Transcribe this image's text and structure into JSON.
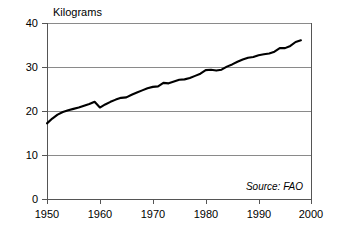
{
  "chart_data": {
    "type": "line",
    "title": "Kilograms",
    "xlabel": "",
    "ylabel": "Kilograms",
    "xlim": [
      1950,
      2000
    ],
    "ylim": [
      0,
      40
    ],
    "grid": true,
    "legend": false,
    "legend_position": "none",
    "annotations": [
      {
        "text": "Source: FAO",
        "position": "bottom-right",
        "style": "italic"
      }
    ],
    "y_ticks": [
      0,
      10,
      20,
      30,
      40
    ],
    "y_tick_labels": [
      "0",
      "10",
      "20",
      "30",
      "40"
    ],
    "x_ticks": [
      1950,
      1960,
      1970,
      1980,
      1990,
      2000
    ],
    "x_tick_labels": [
      "1950",
      "1960",
      "1970",
      "1980",
      "1990",
      "2000"
    ],
    "series": [
      {
        "name": "World per capita consumption",
        "color": "#000000",
        "x": [
          1950,
          1951,
          1952,
          1953,
          1954,
          1955,
          1956,
          1957,
          1958,
          1959,
          1960,
          1961,
          1962,
          1963,
          1964,
          1965,
          1966,
          1967,
          1968,
          1969,
          1970,
          1971,
          1972,
          1973,
          1974,
          1975,
          1976,
          1977,
          1978,
          1979,
          1980,
          1981,
          1982,
          1983,
          1984,
          1985,
          1986,
          1987,
          1988,
          1989,
          1990,
          1991,
          1992,
          1993,
          1994,
          1995,
          1996,
          1997,
          1998
        ],
        "values": [
          17.3,
          18.4,
          19.3,
          19.9,
          20.3,
          20.6,
          20.9,
          21.3,
          21.7,
          22.2,
          20.9,
          21.6,
          22.2,
          22.7,
          23.1,
          23.2,
          23.8,
          24.3,
          24.8,
          25.3,
          25.6,
          25.7,
          26.5,
          26.4,
          26.8,
          27.2,
          27.3,
          27.6,
          28.1,
          28.6,
          29.4,
          29.5,
          29.3,
          29.5,
          30.2,
          30.7,
          31.3,
          31.8,
          32.2,
          32.4,
          32.8,
          33.0,
          33.2,
          33.6,
          34.4,
          34.4,
          34.9,
          35.8,
          36.2
        ]
      }
    ]
  },
  "chart": {
    "title_label": "Kilograms",
    "source_label": "Source: FAO"
  }
}
